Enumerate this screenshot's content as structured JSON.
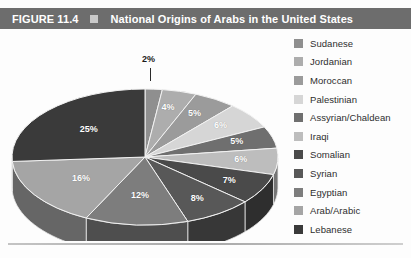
{
  "header": {
    "figure_number": "FIGURE 11.4",
    "bullet_icon": "square-bullet-icon",
    "title": "National Origins of Arabs in the United States",
    "bar_color": "#6d6d6d",
    "text_color": "#ffffff"
  },
  "chart_data": {
    "type": "pie",
    "title": "National Origins of Arabs in the United States",
    "render_style": "3d-pie",
    "start_angle_deg": 0,
    "direction": "clockwise",
    "legend_position": "right",
    "grid": false,
    "value_unit": "%",
    "categories": [
      "Sudanese",
      "Jordanian",
      "Moroccan",
      "Palestinian",
      "Assyrian/Chaldean",
      "Iraqi",
      "Somalian",
      "Syrian",
      "Egyptian",
      "Arab/Arabic",
      "Lebanese"
    ],
    "values": [
      2,
      4,
      5,
      6,
      5,
      6,
      7,
      8,
      12,
      16,
      25
    ],
    "labels": [
      "2%",
      "4%",
      "5%",
      "6%",
      "5%",
      "6%",
      "7%",
      "8%",
      "12%",
      "16%",
      "25%"
    ],
    "colors": [
      "#8f8f8f",
      "#adadad",
      "#9b9b9b",
      "#d6d6d6",
      "#6f6f6f",
      "#bdbdbd",
      "#4a4a4a",
      "#585858",
      "#7d7d7d",
      "#a5a5a5",
      "#3a3a3a"
    ]
  },
  "legend": {
    "items": [
      {
        "label": "Sudanese",
        "color": "#8f8f8f"
      },
      {
        "label": "Jordanian",
        "color": "#adadad"
      },
      {
        "label": "Moroccan",
        "color": "#9b9b9b"
      },
      {
        "label": "Palestinian",
        "color": "#d6d6d6"
      },
      {
        "label": "Assyrian/Chaldean",
        "color": "#6f6f6f"
      },
      {
        "label": "Iraqi",
        "color": "#bdbdbd"
      },
      {
        "label": "Somalian",
        "color": "#4a4a4a"
      },
      {
        "label": "Syrian",
        "color": "#585858"
      },
      {
        "label": "Egyptian",
        "color": "#7d7d7d"
      },
      {
        "label": "Arab/Arabic",
        "color": "#a5a5a5"
      },
      {
        "label": "Lebanese",
        "color": "#3a3a3a"
      }
    ]
  }
}
